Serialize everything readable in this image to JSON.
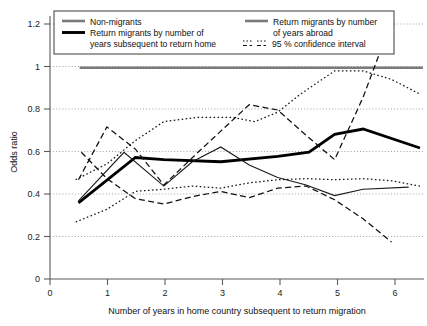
{
  "chart_data": {
    "type": "line",
    "title": "",
    "xlabel": "Number of years in home country subsequent to return migration",
    "ylabel": "Odds ratio",
    "xlim": [
      0,
      6.6
    ],
    "ylim": [
      0,
      1.27
    ],
    "xticks": [
      "0",
      "1",
      "2",
      "3",
      "4",
      "5",
      "6"
    ],
    "xtick_values": [
      0,
      1,
      2,
      3,
      4,
      5,
      6
    ],
    "yticks": [
      "0",
      "0.2",
      "0.4",
      "0.6",
      "0.8",
      "1",
      "1.2"
    ],
    "ytick_values": [
      0,
      0.2,
      0.4,
      0.6,
      0.8,
      1.0,
      1.2
    ],
    "grid": "horizontal-dotted",
    "legend_position": "top-inside",
    "series": [
      {
        "name": "Non-migrants",
        "style": "thick-gray-reference",
        "color": "#7a7a7a",
        "width": 2.6,
        "dash": "none",
        "x": [
          0.52,
          6.55
        ],
        "y": [
          1.0,
          1.0
        ]
      },
      {
        "name": "Return migrants by number of years subsequent to return home",
        "style": "thick-black",
        "color": "#000000",
        "width": 2.8,
        "dash": "none",
        "x": [
          0.5,
          1.5,
          2.0,
          3.0,
          4.0,
          4.55,
          5.0,
          5.5,
          6.5
        ],
        "y": [
          0.36,
          0.575,
          0.565,
          0.555,
          0.58,
          0.6,
          0.685,
          0.71,
          0.62
        ]
      },
      {
        "name": "Return migrants by number of years abroad",
        "style": "thin-black",
        "color": "#1a1a1a",
        "width": 1.1,
        "dash": "none",
        "x": [
          0.5,
          1.3,
          2.0,
          2.5,
          3.0,
          3.5,
          4.0,
          4.5,
          5.0,
          5.5,
          6.3
        ],
        "y": [
          0.37,
          0.6,
          0.44,
          0.555,
          0.625,
          0.54,
          0.48,
          0.445,
          0.395,
          0.425,
          0.435
        ]
      },
      {
        "name": "95 % confidence interval",
        "style": "dotted-upper",
        "color": "#161616",
        "width": 1.25,
        "dash": "1.6,2.4",
        "x": [
          0.45,
          1.0,
          1.5,
          2.0,
          2.6,
          3.2,
          3.6,
          4.0,
          4.4,
          5.0,
          5.5,
          6.0,
          6.5
        ],
        "y": [
          0.47,
          0.545,
          0.655,
          0.745,
          0.765,
          0.765,
          0.745,
          0.79,
          0.875,
          0.985,
          0.985,
          0.945,
          0.875
        ]
      },
      {
        "name": "95 % confidence interval",
        "style": "dotted-lower",
        "color": "#161616",
        "width": 1.25,
        "dash": "1.6,2.4",
        "x": [
          0.45,
          1.0,
          1.5,
          2.0,
          2.5,
          3.0,
          3.5,
          4.0,
          4.5,
          5.0,
          5.5,
          6.0,
          6.5
        ],
        "y": [
          0.27,
          0.33,
          0.415,
          0.425,
          0.44,
          0.43,
          0.455,
          0.47,
          0.475,
          0.47,
          0.475,
          0.465,
          0.44
        ]
      },
      {
        "name": "95 % confidence interval",
        "style": "dashed-upper",
        "color": "#111111",
        "width": 1.25,
        "dash": "6,3.4",
        "x": [
          0.5,
          1.0,
          1.5,
          2.0,
          2.6,
          3.0,
          3.5,
          4.0,
          4.5,
          5.0,
          5.5,
          6.0
        ],
        "y": [
          0.47,
          0.72,
          0.615,
          0.445,
          0.6,
          0.7,
          0.825,
          0.8,
          0.68,
          0.565,
          0.86,
          1.22
        ]
      },
      {
        "name": "95 % confidence interval",
        "style": "dashed-lower",
        "color": "#111111",
        "width": 1.25,
        "dash": "6,3.4",
        "x": [
          0.55,
          1.0,
          1.5,
          2.0,
          2.5,
          3.0,
          3.5,
          4.0,
          4.5,
          5.0,
          5.5,
          6.0
        ],
        "y": [
          0.6,
          0.475,
          0.38,
          0.355,
          0.39,
          0.415,
          0.385,
          0.43,
          0.44,
          0.375,
          0.285,
          0.175
        ]
      }
    ]
  },
  "axes": {
    "ylabel": "Odds ratio",
    "xlabel": "Number of years in home country subsequent to return migration",
    "xtick_labels": [
      "0",
      "1",
      "2",
      "3",
      "4",
      "5",
      "6"
    ],
    "ytick_labels": [
      "0",
      "0.2",
      "0.4",
      "0.6",
      "0.8",
      "1",
      "1.2"
    ]
  },
  "legend": {
    "items": [
      {
        "label": "Non-migrants",
        "swatch": "thick-gray-line",
        "color": "#7a7a7a"
      },
      {
        "label": "Return migrants by number",
        "label_line2": "of years abroad",
        "swatch": "thick-gray-line",
        "color": "#7a7a7a"
      },
      {
        "label": "Return migrants by number of",
        "label_line2": "years subsequent to return home",
        "swatch": "thick-black-line",
        "color": "#000000"
      },
      {
        "label": "95 % confidence interval",
        "swatch": "dash-dot-pair",
        "color": "#111111"
      }
    ]
  },
  "colors": {
    "background": "#ffffff",
    "axis": "#5b5b5b",
    "grid": "#8c8c8c",
    "text": "#111111",
    "reference_line": "#7a7a7a",
    "main_series": "#000000"
  }
}
